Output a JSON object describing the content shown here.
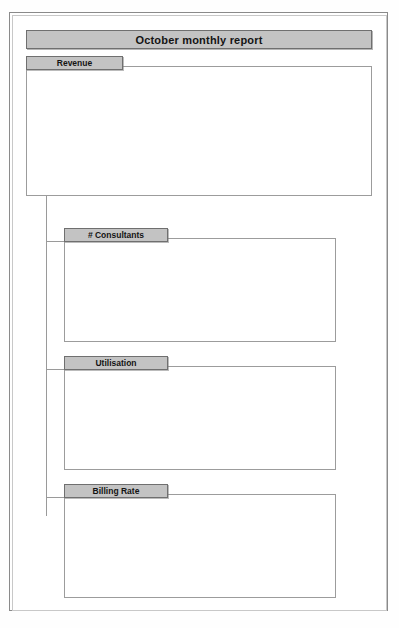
{
  "report": {
    "title": "October monthly report"
  },
  "panels": [
    {
      "label": "Revenue"
    },
    {
      "label": "# Consultants"
    },
    {
      "label": "Utilisation"
    },
    {
      "label": "Billing Rate"
    }
  ],
  "chart_data": [
    {
      "type": "bar",
      "title": "Revenue",
      "categories": [
        "Nov-98",
        "Dec-98",
        "Jan-99",
        "Feb-99",
        "Mar-99",
        "Apr-99",
        "May-99",
        "Jun-99",
        "Jul-99",
        "Aug-99",
        "Sep-99",
        "Oct-99"
      ],
      "values": [
        620000,
        625000,
        575000,
        660000,
        845000,
        830000,
        700000,
        675000,
        600000,
        600000,
        605000,
        575000
      ],
      "ytick_labels": [
        "$900,000",
        "$800,000",
        "$700,000",
        "$600,000",
        "$500,000",
        "$400,000",
        "$300,000",
        "$200,000",
        "$100,000",
        "$-"
      ],
      "ytick_values": [
        900000,
        800000,
        700000,
        600000,
        500000,
        400000,
        300000,
        200000,
        100000,
        0
      ],
      "ylim": [
        0,
        900000
      ],
      "xlabel": "",
      "ylabel": "",
      "grid": true,
      "legend": "none",
      "xtick_rotation": -90
    },
    {
      "type": "bar",
      "title": "# Consultants",
      "categories": [
        "Nov-\n98",
        "Dec-\n98",
        "Jan-\n99",
        "Feb-\n99",
        "Mar-\n99",
        "Apr-\n99",
        "May-\n99",
        "Jun-\n99",
        "Jul-\n99",
        "Aug-\n99",
        "Sep-\n99",
        "Oct-\n99"
      ],
      "values": [
        31,
        30,
        32,
        32,
        32,
        31,
        30,
        30,
        30,
        29,
        30,
        31
      ],
      "ytick_labels": [
        "40",
        "30",
        "20",
        "10",
        "0"
      ],
      "ytick_values": [
        40,
        30,
        20,
        10,
        0
      ],
      "ylim": [
        0,
        40
      ],
      "xlabel": "",
      "ylabel": "",
      "grid": true,
      "legend": "none",
      "xtick_rotation": 0
    },
    {
      "type": "bar",
      "title": "Utilisation",
      "categories": [
        "Nov-\n98",
        "Dec-\n98",
        "Jan-\n99",
        "Feb-\n99",
        "Mar-\n99",
        "Apr-\n99",
        "May-\n99",
        "Jun-\n99",
        "Jul-\n99",
        "Aug-\n99",
        "Sep-\n99",
        "Oct-\n99"
      ],
      "values": [
        57,
        54,
        56,
        60,
        60,
        59,
        59,
        57,
        60,
        61,
        55,
        57
      ],
      "ytick_labels": [
        "80%",
        "60%",
        "40%",
        "20%",
        "0%"
      ],
      "ytick_values": [
        80,
        60,
        40,
        20,
        0
      ],
      "ylim": [
        0,
        80
      ],
      "xlabel": "",
      "ylabel": "",
      "grid": true,
      "legend": "none",
      "xtick_rotation": 0
    },
    {
      "type": "bar",
      "title": "Billing Rate",
      "categories": [
        "Nov-\n98",
        "Dec-\n98",
        "Jan-\n99",
        "Feb-\n99",
        "Mar-\n99",
        "Apr-\n99",
        "May-\n99",
        "Jun-\n99",
        "Jul-\n99",
        "Aug-\n99",
        "Sep-\n99",
        "Oct-\n99"
      ],
      "values": [
        36500,
        38500,
        31500,
        34500,
        42500,
        43500,
        38500,
        38500,
        36000,
        35500,
        37000,
        34500
      ],
      "ytick_labels": [
        "$50,000",
        "$40,000",
        "$30,000",
        "$20,000",
        "$10,000",
        "$-"
      ],
      "ytick_values": [
        50000,
        40000,
        30000,
        20000,
        10000,
        0
      ],
      "ylim": [
        0,
        50000
      ],
      "xlabel": "",
      "ylabel": "",
      "grid": true,
      "legend": "none",
      "xtick_rotation": 0
    }
  ],
  "colors": {
    "header_fill": "#c3c3c3",
    "header_border": "#6f6f6f",
    "plot_background": "#8d8d8d",
    "bar_fill": "#c2c2c2",
    "bar_border": "#303030",
    "page_border": "#8a8a8a",
    "connector": "#9a9a9a"
  },
  "layout": {
    "panel_geometry": [
      {
        "left": 26,
        "top": 56,
        "head_w": 97,
        "body_w": 346,
        "body_h": 130,
        "chart_l": 8,
        "chart_t": 10,
        "chart_w": 330,
        "chart_h": 112,
        "plot_l": 48,
        "plot_t": 4,
        "plot_w": 272,
        "plot_h": 76,
        "xlab_mode": "rot"
      },
      {
        "left": 64,
        "top": 228,
        "head_w": 104,
        "body_w": 272,
        "body_h": 104,
        "chart_l": 8,
        "chart_t": 10,
        "chart_w": 256,
        "chart_h": 88,
        "plot_l": 33,
        "plot_t": 6,
        "plot_w": 213,
        "plot_h": 56,
        "xlab_mode": "flat"
      },
      {
        "left": 64,
        "top": 356,
        "head_w": 104,
        "body_w": 272,
        "body_h": 104,
        "chart_l": 8,
        "chart_t": 10,
        "chart_w": 256,
        "chart_h": 88,
        "plot_l": 33,
        "plot_t": 6,
        "plot_w": 213,
        "plot_h": 56,
        "xlab_mode": "flat"
      },
      {
        "left": 64,
        "top": 484,
        "head_w": 104,
        "body_w": 272,
        "body_h": 104,
        "chart_l": 8,
        "chart_t": 10,
        "chart_w": 256,
        "chart_h": 88,
        "plot_l": 40,
        "plot_t": 6,
        "plot_w": 206,
        "plot_h": 56,
        "xlab_mode": "flat"
      }
    ],
    "connectors": [
      {
        "x": 46,
        "y": 186,
        "w": 1,
        "h": 330
      },
      {
        "x": 46,
        "y": 241,
        "w": 19,
        "h": 1
      },
      {
        "x": 46,
        "y": 369,
        "w": 19,
        "h": 1
      },
      {
        "x": 46,
        "y": 497,
        "w": 19,
        "h": 1
      },
      {
        "x": 46,
        "y": 186,
        "w": 1,
        "h": 1
      }
    ]
  }
}
